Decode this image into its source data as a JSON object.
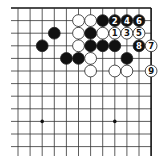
{
  "diagram": {
    "type": "go-board-fragment",
    "visible_corner": "top-right",
    "grid": {
      "columns": 12,
      "rows": 12,
      "origin_x": 18,
      "origin_y": 8,
      "spacing_x": 12.1,
      "spacing_y": 12.6,
      "line_color": "#333333",
      "edge_color": "#111111",
      "top_edge": true,
      "right_edge": true
    },
    "star_points": [
      {
        "col": 2,
        "row": 9
      },
      {
        "col": 8,
        "row": 9
      }
    ],
    "stones": [
      {
        "col": 5,
        "row": 1,
        "color": "white",
        "label": ""
      },
      {
        "col": 6,
        "row": 1,
        "color": "white",
        "label": ""
      },
      {
        "col": 7,
        "row": 1,
        "color": "black",
        "label": ""
      },
      {
        "col": 8,
        "row": 1,
        "color": "black",
        "label": "2"
      },
      {
        "col": 9,
        "row": 1,
        "color": "black",
        "label": "4"
      },
      {
        "col": 10,
        "row": 1,
        "color": "black",
        "label": "6"
      },
      {
        "col": 3,
        "row": 2,
        "color": "black",
        "label": ""
      },
      {
        "col": 5,
        "row": 2,
        "color": "white",
        "label": ""
      },
      {
        "col": 6,
        "row": 2,
        "color": "black",
        "label": ""
      },
      {
        "col": 7,
        "row": 2,
        "color": "white",
        "label": ""
      },
      {
        "col": 8,
        "row": 2,
        "color": "white",
        "label": "1"
      },
      {
        "col": 9,
        "row": 2,
        "color": "white",
        "label": "3"
      },
      {
        "col": 10,
        "row": 2,
        "color": "white",
        "label": "5"
      },
      {
        "col": 2,
        "row": 3,
        "color": "black",
        "label": ""
      },
      {
        "col": 5,
        "row": 3,
        "color": "white",
        "label": ""
      },
      {
        "col": 6,
        "row": 3,
        "color": "black",
        "label": ""
      },
      {
        "col": 7,
        "row": 3,
        "color": "black",
        "label": ""
      },
      {
        "col": 8,
        "row": 3,
        "color": "black",
        "label": ""
      },
      {
        "col": 10,
        "row": 3,
        "color": "black",
        "label": "8"
      },
      {
        "col": 11,
        "row": 3,
        "color": "white",
        "label": "7"
      },
      {
        "col": 4,
        "row": 4,
        "color": "black",
        "label": ""
      },
      {
        "col": 5,
        "row": 4,
        "color": "black",
        "label": ""
      },
      {
        "col": 6,
        "row": 4,
        "color": "white",
        "label": ""
      },
      {
        "col": 9,
        "row": 4,
        "color": "black",
        "label": ""
      },
      {
        "col": 6,
        "row": 5,
        "color": "white",
        "label": ""
      },
      {
        "col": 8,
        "row": 5,
        "color": "white",
        "label": ""
      },
      {
        "col": 9,
        "row": 5,
        "color": "white",
        "label": ""
      },
      {
        "col": 11,
        "row": 5,
        "color": "white",
        "label": "9"
      }
    ],
    "colors": {
      "black_stone": "#111111",
      "white_stone": "#ffffff",
      "stone_outline": "#222222",
      "label_on_black": "#ffffff",
      "label_on_white": "#111111"
    }
  }
}
